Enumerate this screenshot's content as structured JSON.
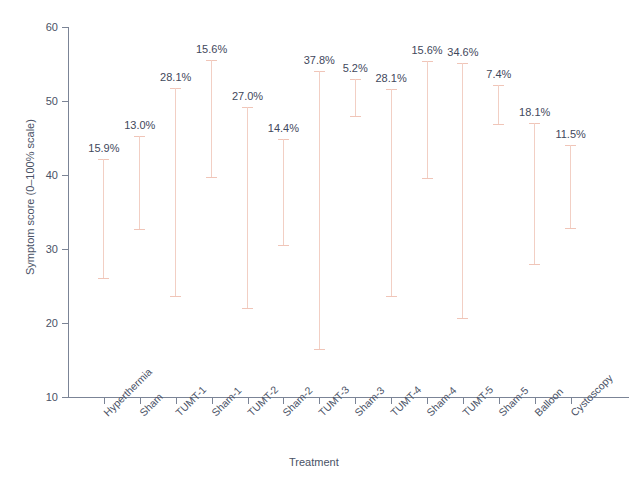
{
  "chart_data": {
    "type": "bar",
    "title": "",
    "xlabel": "Treatment",
    "ylabel": "Symptom score (0–100% scale)",
    "ylim": [
      10,
      60
    ],
    "yticks": [
      10,
      20,
      30,
      40,
      50,
      60
    ],
    "ytick_labels": [
      "10",
      "20",
      "30",
      "40",
      "50",
      "60"
    ],
    "grid": false,
    "legend": null,
    "categories": [
      "Hyperthermia",
      "Sham",
      "TUMT-1",
      "Sham-1",
      "TUMT-2",
      "Sham-2",
      "TUMT-3",
      "Sham-3",
      "TUMT-4",
      "Sham-4",
      "TUMT-5",
      "Sham-5",
      "Balloon",
      "Cystoscopy"
    ],
    "series": [
      {
        "name": "Baseline score",
        "values": [
          42.1,
          45.3,
          51.7,
          55.5,
          49.2,
          44.9,
          54.1,
          53.0,
          51.6,
          55.4,
          55.2,
          52.1,
          47.0,
          44.1
        ]
      },
      {
        "name": "Post-treatment score",
        "values": [
          25.9,
          32.6,
          23.5,
          39.6,
          21.9,
          30.4,
          16.3,
          47.9,
          23.5,
          39.5,
          20.6,
          46.8,
          27.8,
          32.7
        ]
      }
    ],
    "annotations": [
      "15.9%",
      "13.0%",
      "28.1%",
      "15.6%",
      "27.0%",
      "14.4%",
      "37.8%",
      "5.2%",
      "28.1%",
      "15.6%",
      "34.6%",
      "7.4%",
      "18.1%",
      "11.5%"
    ],
    "annotation_note": "Percent label printed above each range bar"
  },
  "colors": {
    "bar": "#f0c5b8",
    "axis": "#7b8496",
    "text": "#4a5266",
    "annotation": "#3f485c",
    "background": "#ffffff"
  },
  "footnote": ""
}
